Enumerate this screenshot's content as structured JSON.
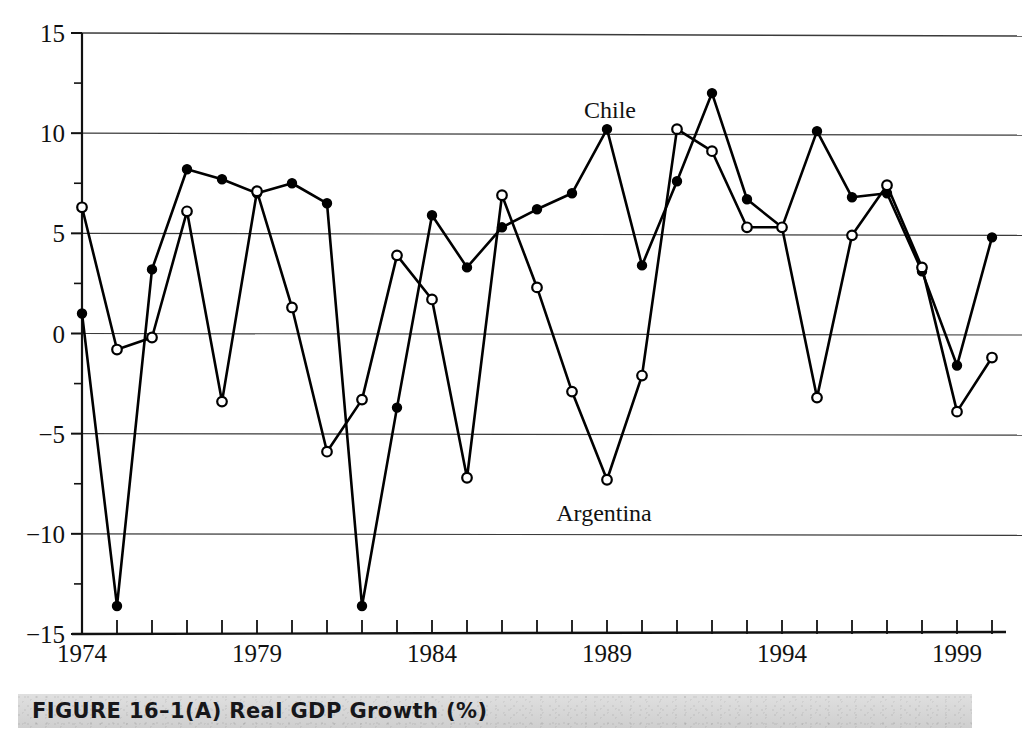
{
  "figure": {
    "caption": "FIGURE 16–1(A) Real GDP Growth (%)",
    "caption_number": "16–1(A)",
    "caption_title": "Real GDP Growth (%)"
  },
  "annotations": {
    "chile_label": "Chile",
    "argentina_label": "Argentina"
  },
  "chart_data": {
    "type": "line",
    "title": "Real GDP Growth (%)",
    "xlabel": "",
    "ylabel": "",
    "ylim": [
      -15,
      15
    ],
    "xlim": [
      1974,
      2000
    ],
    "yticks": [
      -15,
      -10,
      -5,
      0,
      5,
      10,
      15
    ],
    "ytick_labels": [
      "−15",
      "−10",
      "−5",
      "0",
      "5",
      "10",
      "15"
    ],
    "yminor_step": 2.5,
    "grid": "horizontal",
    "legend_position": "inline-annotation",
    "x": [
      1974,
      1975,
      1976,
      1977,
      1978,
      1979,
      1980,
      1981,
      1982,
      1983,
      1984,
      1985,
      1986,
      1987,
      1988,
      1989,
      1990,
      1991,
      1992,
      1993,
      1994,
      1995,
      1996,
      1997,
      1998,
      1999,
      2000
    ],
    "xtick_labels_shown": [
      "1974",
      "1979",
      "1984",
      "1989",
      "1994",
      "1999"
    ],
    "xtick_labeled_years": [
      1974,
      1979,
      1984,
      1989,
      1994,
      1999
    ],
    "series": [
      {
        "name": "Chile",
        "marker": "filled-circle",
        "color": "#000000",
        "values": [
          1.0,
          -13.6,
          3.2,
          8.2,
          7.7,
          7.0,
          7.5,
          6.5,
          -13.6,
          -3.7,
          5.9,
          3.3,
          5.3,
          6.2,
          7.0,
          10.2,
          3.4,
          7.6,
          12.0,
          6.7,
          5.3,
          10.1,
          6.8,
          7.0,
          3.1,
          -1.6,
          4.8
        ]
      },
      {
        "name": "Argentina",
        "marker": "open-circle",
        "color": "#000000",
        "values": [
          6.3,
          -0.8,
          -0.2,
          6.1,
          -3.4,
          7.1,
          1.3,
          -5.9,
          -3.3,
          3.9,
          1.7,
          -7.2,
          6.9,
          2.3,
          -2.9,
          -7.3,
          -2.1,
          10.2,
          9.1,
          5.3,
          5.3,
          -3.2,
          4.9,
          7.4,
          3.3,
          -3.9,
          -1.2
        ]
      }
    ]
  }
}
